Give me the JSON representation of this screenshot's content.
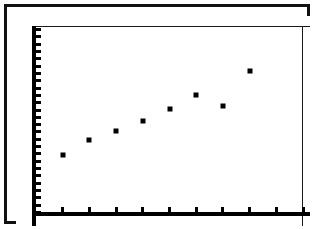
{
  "figure": {
    "kind": "graphing-calculator-scatter-plot",
    "background_color": "#ffffff",
    "ink_color": "#000000",
    "border_color": "#111111"
  },
  "chart_data": {
    "type": "scatter",
    "title": "",
    "subtitle": "",
    "xlabel": "",
    "ylabel": "",
    "grid": false,
    "legend": null,
    "legend_position": "none",
    "marker": "filled-square",
    "marker_color": "#000000",
    "xlim": [
      0,
      10
    ],
    "ylim": [
      0,
      26
    ],
    "x_tick_count": 10,
    "y_tick_count": 26,
    "x_tick_labels": [],
    "y_tick_labels": [],
    "x": [
      1,
      2,
      3,
      4,
      5,
      6,
      7,
      8
    ],
    "y": [
      8.4,
      10.4,
      11.7,
      13.0,
      14.6,
      16.5,
      15.1,
      19.9
    ],
    "points": [
      {
        "x": 1,
        "y": 8.4
      },
      {
        "x": 2,
        "y": 10.4
      },
      {
        "x": 3,
        "y": 11.7
      },
      {
        "x": 4,
        "y": 13.0
      },
      {
        "x": 5,
        "y": 14.6
      },
      {
        "x": 6,
        "y": 16.5
      },
      {
        "x": 7,
        "y": 15.1
      },
      {
        "x": 8,
        "y": 19.9
      }
    ],
    "annotations": []
  }
}
